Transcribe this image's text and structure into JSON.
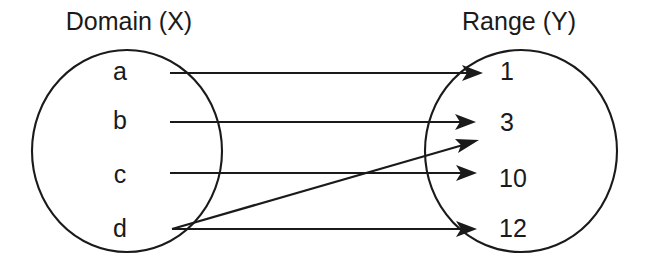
{
  "diagram": {
    "type": "function-mapping-diagram",
    "background_color": "#ffffff",
    "stroke_color": "#1a1a1a",
    "domain": {
      "title": "Domain (X)",
      "title_x": 129,
      "title_y": 30,
      "ellipse": {
        "cx": 127,
        "cy": 151,
        "rx": 95,
        "ry": 101
      },
      "elements": [
        {
          "label": "a",
          "x": 120,
          "y": 73
        },
        {
          "label": "b",
          "x": 120,
          "y": 122
        },
        {
          "label": "c",
          "x": 120,
          "y": 176
        },
        {
          "label": "d",
          "x": 120,
          "y": 230
        }
      ]
    },
    "range": {
      "title": "Range (Y)",
      "title_x": 519,
      "title_y": 30,
      "ellipse": {
        "cx": 521,
        "cy": 151,
        "rx": 96,
        "ry": 101
      },
      "elements": [
        {
          "label": "1",
          "x": 507,
          "y": 73
        },
        {
          "label": "3",
          "x": 507,
          "y": 124
        },
        {
          "label": "10",
          "x": 513,
          "y": 180
        },
        {
          "label": "12",
          "x": 513,
          "y": 230
        }
      ]
    },
    "mappings": [
      {
        "from": "a",
        "to": "1",
        "x1": 170,
        "y1": 73,
        "x2": 483,
        "y2": 73
      },
      {
        "from": "b",
        "to": "3",
        "x1": 170,
        "y1": 122,
        "x2": 476,
        "y2": 122
      },
      {
        "from": "c",
        "to": "10",
        "x1": 170,
        "y1": 173,
        "x2": 477,
        "y2": 173
      },
      {
        "from": "d",
        "to": "3",
        "x1": 172,
        "y1": 229,
        "x2": 479,
        "y2": 140
      },
      {
        "from": "d",
        "to": "12",
        "x1": 172,
        "y1": 229,
        "x2": 477,
        "y2": 229
      }
    ]
  }
}
